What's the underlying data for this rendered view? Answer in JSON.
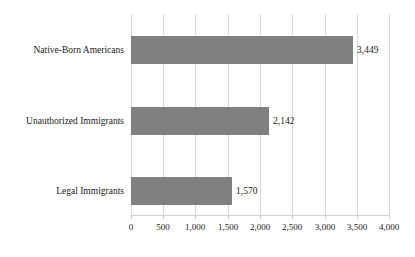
{
  "chart_data": {
    "type": "bar",
    "orientation": "horizontal",
    "title": "",
    "subtitle": "",
    "xlabel": "",
    "ylabel": "",
    "categories": [
      "Native-Born Americans",
      "Unauthorized Immigrants",
      "Legal Immigrants"
    ],
    "values": [
      3449,
      2142,
      1570
    ],
    "value_labels": [
      "3,449",
      "2,142",
      "1,570"
    ],
    "xlim": [
      0,
      4000
    ],
    "xticks": [
      0,
      500,
      1000,
      1500,
      2000,
      2500,
      3000,
      3500,
      4000
    ],
    "xtick_labels": [
      "0",
      "500",
      "1,000",
      "1,500",
      "2,000",
      "2,500",
      "3,000",
      "3,500",
      "4,000"
    ],
    "grid": "vertical",
    "legend": "none",
    "series": [
      {
        "name": "Incarceration rate",
        "values": [
          3449,
          2142,
          1570
        ]
      }
    ],
    "colors": {
      "bar": "#808080",
      "gridline": "#d9d9d9",
      "axis": "#d0d0d0",
      "text": "#1a1a1a",
      "background": "#ffffff"
    }
  }
}
